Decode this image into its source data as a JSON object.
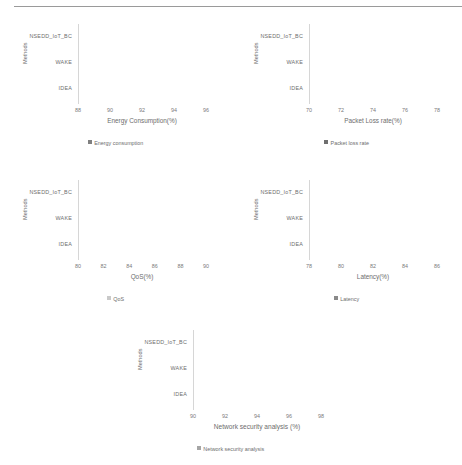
{
  "page": {
    "background": "#ffffff",
    "top_rule_color": "#9a9a9a"
  },
  "axis_title_y": "Methods",
  "categories": [
    "NSEDD_IoT_BC",
    "WAKE",
    "IDEA"
  ],
  "chart_data": [
    {
      "type": "bar",
      "orientation": "horizontal",
      "id": "energy-consumption",
      "title": "",
      "xlabel": "Energy Consumption(%)",
      "ylabel": "Methods",
      "categories": [
        "NSEDD_IoT_BC",
        "WAKE",
        "IDEA"
      ],
      "values": [
        94.9,
        93.0,
        91.4
      ],
      "series": [
        {
          "name": "Energy consumption",
          "values": [
            94.9,
            93.0,
            91.4
          ]
        }
      ],
      "xlim": [
        88,
        96
      ],
      "xticks": [
        88,
        90,
        92,
        94,
        96
      ],
      "tick_labels": [
        "88",
        "90",
        "92",
        "94",
        "96"
      ],
      "legend": "Energy consumption",
      "legend_position": "bottom",
      "grid": false,
      "bar_color": "#808080"
    },
    {
      "type": "bar",
      "orientation": "horizontal",
      "id": "packet-loss-rate",
      "title": "",
      "xlabel": "Packet Loss rate(%)",
      "ylabel": "Methods",
      "categories": [
        "NSEDD_IoT_BC",
        "WAKE",
        "IDEA"
      ],
      "values": [
        76.9,
        75.2,
        73.2
      ],
      "series": [
        {
          "name": "Packet loss rate",
          "values": [
            76.9,
            75.2,
            73.2
          ]
        }
      ],
      "xlim": [
        70,
        78
      ],
      "xticks": [
        70,
        72,
        74,
        76,
        78
      ],
      "tick_labels": [
        "70",
        "72",
        "74",
        "76",
        "78"
      ],
      "legend": "Packet loss rate",
      "legend_position": "bottom",
      "grid": false,
      "bar_color": "#6f6f6f"
    },
    {
      "type": "bar",
      "orientation": "horizontal",
      "id": "qos",
      "title": "",
      "xlabel": "QoS(%)",
      "ylabel": "Methods",
      "categories": [
        "NSEDD_IoT_BC",
        "WAKE",
        "IDEA"
      ],
      "values": [
        88.8,
        85.0,
        82.9
      ],
      "series": [
        {
          "name": "QoS",
          "values": [
            88.8,
            85.0,
            82.9
          ]
        }
      ],
      "xlim": [
        80,
        90
      ],
      "xticks": [
        80,
        82,
        84,
        86,
        88,
        90
      ],
      "tick_labels": [
        "80",
        "82",
        "84",
        "86",
        "88",
        "90"
      ],
      "legend": "QoS",
      "legend_position": "bottom",
      "grid": false,
      "bar_color": "#c9c9c9"
    },
    {
      "type": "bar",
      "orientation": "horizontal",
      "id": "latency",
      "title": "",
      "xlabel": "Latency(%)",
      "ylabel": "Methods",
      "categories": [
        "NSEDD_IoT_BC",
        "WAKE",
        "IDEA"
      ],
      "values": [
        84.6,
        83.1,
        80.6
      ],
      "series": [
        {
          "name": "Latency",
          "values": [
            84.6,
            83.1,
            80.6
          ]
        }
      ],
      "xlim": [
        78,
        86
      ],
      "xticks": [
        78,
        80,
        82,
        84,
        86
      ],
      "tick_labels": [
        "78",
        "80",
        "82",
        "84",
        "86"
      ],
      "legend": "Latency",
      "legend_position": "bottom",
      "grid": false,
      "bar_color": "#8a8a8a"
    },
    {
      "type": "bar",
      "orientation": "horizontal",
      "id": "network-security-analysis",
      "title": "",
      "xlabel": "Network security analysis (%)",
      "ylabel": "Methods",
      "categories": [
        "NSEDD_IoT_BC",
        "WAKE",
        "IDEA"
      ],
      "values": [
        97.2,
        95.0,
        93.0
      ],
      "series": [
        {
          "name": "Network security analysis",
          "values": [
            97.2,
            95.0,
            93.0
          ]
        }
      ],
      "xlim": [
        90,
        98
      ],
      "xticks": [
        90,
        92,
        94,
        96,
        98
      ],
      "tick_labels": [
        "90",
        "92",
        "94",
        "96",
        "98"
      ],
      "legend": "Network security analysis",
      "legend_position": "bottom",
      "grid": false,
      "bar_color": "#a5a5a5"
    }
  ]
}
